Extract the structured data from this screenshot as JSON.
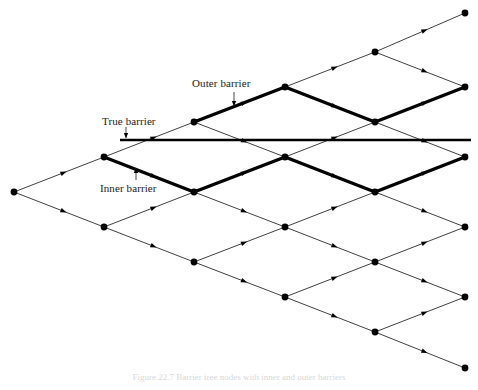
{
  "figure": {
    "caption": "Figure 22.7   Barrier tree nodes with inner and outer barriers",
    "background_color": "#ffffff",
    "ink_color": "#000000"
  },
  "labels": {
    "outer_barrier": "Outer barrier",
    "true_barrier": "True barrier",
    "inner_barrier": "Inner barrier"
  },
  "chart_data": {
    "type": "diagram",
    "geometry": {
      "root": [
        14,
        192
      ],
      "dx": 90.2,
      "dy": 35.0,
      "steps": 5,
      "node_radius": 3.4
    },
    "nodes": [
      {
        "id": "n0_0",
        "step": 0,
        "level": 0,
        "x": 14,
        "y": 192
      },
      {
        "id": "n1_1",
        "step": 1,
        "level": 1,
        "x": 104,
        "y": 157
      },
      {
        "id": "n1_-1",
        "step": 1,
        "level": -1,
        "x": 104,
        "y": 227
      },
      {
        "id": "n2_2",
        "step": 2,
        "level": 2,
        "x": 194,
        "y": 122
      },
      {
        "id": "n2_0",
        "step": 2,
        "level": 0,
        "x": 194,
        "y": 192
      },
      {
        "id": "n2_-2",
        "step": 2,
        "level": -2,
        "x": 194,
        "y": 262
      },
      {
        "id": "n3_3",
        "step": 3,
        "level": 3,
        "x": 285,
        "y": 87
      },
      {
        "id": "n3_1",
        "step": 3,
        "level": 1,
        "x": 285,
        "y": 157
      },
      {
        "id": "n3_-1",
        "step": 3,
        "level": -1,
        "x": 285,
        "y": 227
      },
      {
        "id": "n3_-3",
        "step": 3,
        "level": -3,
        "x": 285,
        "y": 297
      },
      {
        "id": "n4_4",
        "step": 4,
        "level": 4,
        "x": 375,
        "y": 52
      },
      {
        "id": "n4_2",
        "step": 4,
        "level": 2,
        "x": 375,
        "y": 122
      },
      {
        "id": "n4_0",
        "step": 4,
        "level": 0,
        "x": 375,
        "y": 192
      },
      {
        "id": "n4_-2",
        "step": 4,
        "level": -2,
        "x": 375,
        "y": 262
      },
      {
        "id": "n4_-4",
        "step": 4,
        "level": -4,
        "x": 375,
        "y": 332
      },
      {
        "id": "n5_5",
        "step": 5,
        "level": 5,
        "x": 465,
        "y": 13
      },
      {
        "id": "n5_3",
        "step": 5,
        "level": 3,
        "x": 465,
        "y": 87
      },
      {
        "id": "n5_1",
        "step": 5,
        "level": 1,
        "x": 465,
        "y": 157
      },
      {
        "id": "n5_-1",
        "step": 5,
        "level": -1,
        "x": 465,
        "y": 227
      },
      {
        "id": "n5_-3",
        "step": 5,
        "level": -3,
        "x": 465,
        "y": 297
      },
      {
        "id": "n5_-5",
        "step": 5,
        "level": -5,
        "x": 465,
        "y": 368
      }
    ],
    "edges": [
      [
        "n0_0",
        "n1_1"
      ],
      [
        "n0_0",
        "n1_-1"
      ],
      [
        "n1_1",
        "n2_2"
      ],
      [
        "n1_1",
        "n2_0"
      ],
      [
        "n1_-1",
        "n2_0"
      ],
      [
        "n1_-1",
        "n2_-2"
      ],
      [
        "n2_2",
        "n3_3"
      ],
      [
        "n2_2",
        "n3_1"
      ],
      [
        "n2_0",
        "n3_1"
      ],
      [
        "n2_0",
        "n3_-1"
      ],
      [
        "n2_-2",
        "n3_-1"
      ],
      [
        "n2_-2",
        "n3_-3"
      ],
      [
        "n3_3",
        "n4_4"
      ],
      [
        "n3_3",
        "n4_2"
      ],
      [
        "n3_1",
        "n4_2"
      ],
      [
        "n3_1",
        "n4_0"
      ],
      [
        "n3_-1",
        "n4_0"
      ],
      [
        "n3_-1",
        "n4_-2"
      ],
      [
        "n3_-3",
        "n4_-2"
      ],
      [
        "n3_-3",
        "n4_-4"
      ],
      [
        "n4_4",
        "n5_5"
      ],
      [
        "n4_4",
        "n5_3"
      ],
      [
        "n4_2",
        "n5_3"
      ],
      [
        "n4_2",
        "n5_1"
      ],
      [
        "n4_0",
        "n5_1"
      ],
      [
        "n4_0",
        "n5_-1"
      ],
      [
        "n4_-2",
        "n5_-1"
      ],
      [
        "n4_-2",
        "n5_-3"
      ],
      [
        "n4_-4",
        "n5_-3"
      ],
      [
        "n4_-4",
        "n5_-5"
      ]
    ],
    "barriers": {
      "outer": {
        "label": "Outer barrier",
        "points": [
          [
            194,
            122
          ],
          [
            285,
            87
          ],
          [
            375,
            122
          ],
          [
            465,
            87
          ]
        ],
        "stroke_width": 3.4
      },
      "inner": {
        "label": "Inner barrier",
        "points": [
          [
            104,
            157
          ],
          [
            194,
            192
          ],
          [
            285,
            157
          ],
          [
            375,
            192
          ],
          [
            465,
            157
          ]
        ],
        "stroke_width": 3.4
      },
      "true": {
        "label": "True barrier",
        "y": 140,
        "x_start": 120,
        "x_end": 471,
        "stroke_width": 2.4
      }
    },
    "annotations": [
      {
        "name": "outer-barrier-annotation",
        "text": "Outer barrier",
        "text_x": 192,
        "text_y": 77,
        "arrow_from": [
          234,
          92
        ],
        "arrow_to": [
          234,
          106
        ],
        "direction": "down"
      },
      {
        "name": "true-barrier-annotation",
        "text": "True barrier",
        "text_x": 102,
        "text_y": 115,
        "arrow_from": [
          126,
          127
        ],
        "arrow_to": [
          126,
          138
        ],
        "direction": "down"
      },
      {
        "name": "inner-barrier-annotation",
        "text": "Inner barrier",
        "text_x": 100,
        "text_y": 182,
        "arrow_from": [
          136,
          180
        ],
        "arrow_to": [
          136,
          168
        ],
        "direction": "up"
      }
    ]
  }
}
